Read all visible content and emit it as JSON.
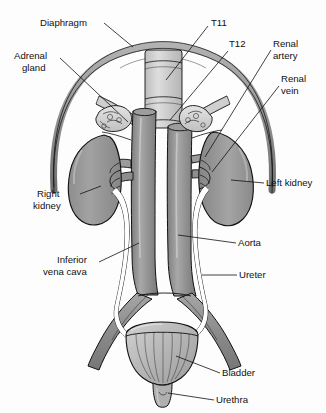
{
  "figure": {
    "width": 326,
    "height": 413,
    "background_color": "#fdfdfd"
  },
  "palette": {
    "outline": "#111111",
    "kidney_fill": "#9a9a9a",
    "kidney_shadow": "#7d7d7d",
    "vessel_fill": "#8f8f8f",
    "vessel_light": "#b6b6b6",
    "diaphragm_fill": "#9d9d9d",
    "adrenal_fill": "#d6d6d6",
    "bladder_fill": "#bdbdbd",
    "spine_fill": "#cfcfcf",
    "ureter_fill": "#ffffff",
    "label_text": "#111111",
    "leader_line": "#111111"
  },
  "labels": [
    {
      "id": "diaphragm",
      "text": "Diaphragm",
      "lines": [
        "Diaphragm"
      ],
      "x": 40,
      "y": 26,
      "anchor": "start",
      "side": "left"
    },
    {
      "id": "adrenal-gland",
      "text": "Adrenal gland",
      "lines": [
        "Adrenal",
        "gland"
      ],
      "x": 14,
      "y": 59,
      "anchor": "start",
      "side": "left"
    },
    {
      "id": "t11",
      "text": "T11",
      "lines": [
        "T11"
      ],
      "x": 211,
      "y": 26,
      "anchor": "start",
      "side": "right"
    },
    {
      "id": "t12",
      "text": "T12",
      "lines": [
        "T12"
      ],
      "x": 229,
      "y": 47,
      "anchor": "start",
      "side": "right"
    },
    {
      "id": "renal-artery",
      "text": "Renal artery",
      "lines": [
        "Renal",
        "artery"
      ],
      "x": 273,
      "y": 47,
      "anchor": "start",
      "side": "right"
    },
    {
      "id": "renal-vein",
      "text": "Renal vein",
      "lines": [
        "Renal",
        "vein"
      ],
      "x": 281,
      "y": 82,
      "anchor": "start",
      "side": "right"
    },
    {
      "id": "right-kidney",
      "text": "Right kidney",
      "lines": [
        "Right",
        "kidney"
      ],
      "x": 37,
      "y": 197,
      "anchor": "start",
      "side": "left"
    },
    {
      "id": "left-kidney",
      "text": "Left kidney",
      "lines": [
        "Left kidney"
      ],
      "x": 266,
      "y": 186,
      "anchor": "start",
      "side": "right"
    },
    {
      "id": "inferior-vena-cava",
      "text": "Inferior vena cava",
      "lines": [
        "Inferior",
        "vena cava"
      ],
      "x": 57,
      "y": 263,
      "anchor": "start",
      "side": "left"
    },
    {
      "id": "aorta",
      "text": "Aorta",
      "lines": [
        "Aorta"
      ],
      "x": 238,
      "y": 246,
      "anchor": "start",
      "side": "right"
    },
    {
      "id": "ureter",
      "text": "Ureter",
      "lines": [
        "Ureter"
      ],
      "x": 239,
      "y": 278,
      "anchor": "start",
      "side": "right"
    },
    {
      "id": "bladder",
      "text": "Bladder",
      "lines": [
        "Bladder"
      ],
      "x": 222,
      "y": 376,
      "anchor": "start",
      "side": "right"
    },
    {
      "id": "urethra",
      "text": "Urethra",
      "lines": [
        "Urethra"
      ],
      "x": 216,
      "y": 403,
      "anchor": "start",
      "side": "right"
    }
  ],
  "structures": [
    {
      "id": "diaphragm",
      "name": "Diaphragm",
      "count": 1
    },
    {
      "id": "adrenal-gland",
      "name": "Adrenal gland",
      "count": 2
    },
    {
      "id": "kidney",
      "name": "Kidney",
      "count": 2
    },
    {
      "id": "renal-artery",
      "name": "Renal artery",
      "count": 2
    },
    {
      "id": "renal-vein",
      "name": "Renal vein",
      "count": 2
    },
    {
      "id": "aorta",
      "name": "Abdominal aorta",
      "count": 1
    },
    {
      "id": "inferior-vena-cava",
      "name": "Inferior vena cava",
      "count": 1
    },
    {
      "id": "ureter",
      "name": "Ureter",
      "count": 2
    },
    {
      "id": "bladder",
      "name": "Urinary bladder",
      "count": 1
    },
    {
      "id": "urethra",
      "name": "Urethra",
      "count": 1
    },
    {
      "id": "vertebra-t11",
      "name": "T11 vertebra",
      "count": 1
    },
    {
      "id": "vertebra-t12",
      "name": "T12 vertebra",
      "count": 1
    }
  ]
}
